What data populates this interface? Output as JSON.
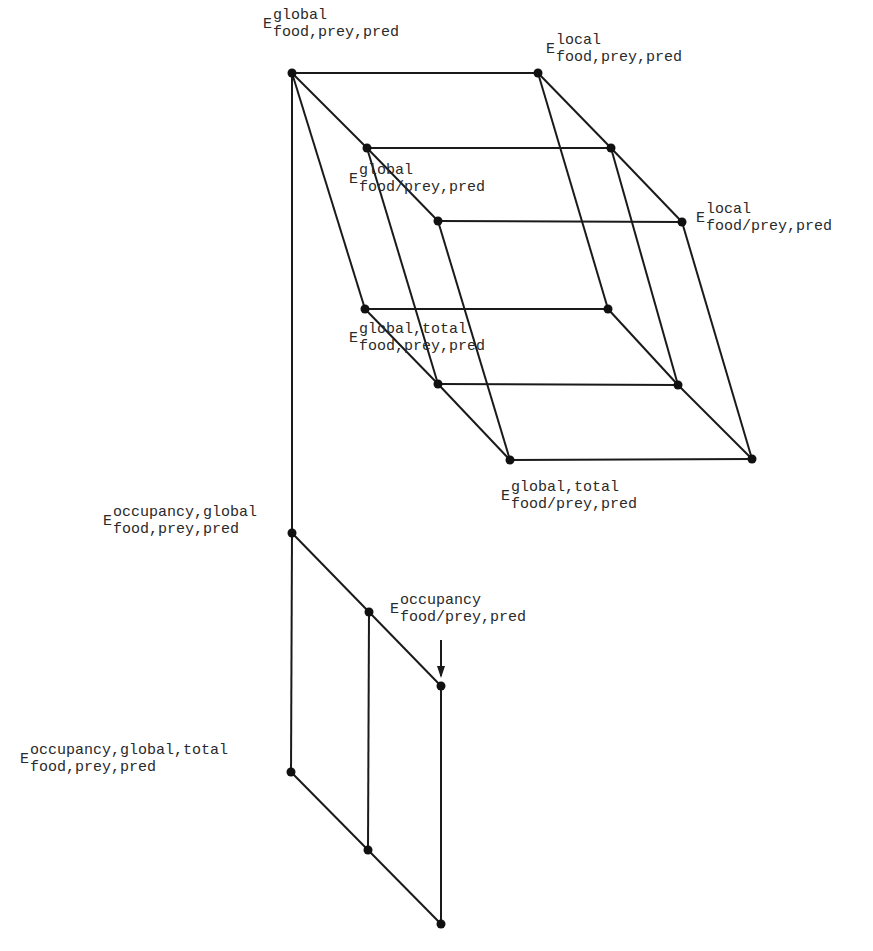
{
  "diagram": {
    "type": "hierarchy-lattice",
    "colors": {
      "line": "#1a1a1a",
      "node": "#111111",
      "text": "#2a2a2a",
      "background": "#ffffff"
    },
    "nodes": [
      {
        "id": "A",
        "x": 292,
        "y": 73
      },
      {
        "id": "B",
        "x": 367,
        "y": 148
      },
      {
        "id": "C",
        "x": 438,
        "y": 221
      },
      {
        "id": "G",
        "x": 538,
        "y": 73
      },
      {
        "id": "H",
        "x": 611,
        "y": 148
      },
      {
        "id": "I",
        "x": 682,
        "y": 222
      },
      {
        "id": "D",
        "x": 365,
        "y": 309
      },
      {
        "id": "E",
        "x": 438,
        "y": 384
      },
      {
        "id": "F",
        "x": 510,
        "y": 460
      },
      {
        "id": "J",
        "x": 608,
        "y": 309
      },
      {
        "id": "K",
        "x": 678,
        "y": 385
      },
      {
        "id": "L",
        "x": 752,
        "y": 459
      },
      {
        "id": "M",
        "x": 292,
        "y": 533
      },
      {
        "id": "N",
        "x": 369,
        "y": 612
      },
      {
        "id": "O",
        "x": 441,
        "y": 686
      },
      {
        "id": "P",
        "x": 291,
        "y": 772
      },
      {
        "id": "Q",
        "x": 368,
        "y": 850
      },
      {
        "id": "R",
        "x": 441,
        "y": 924
      }
    ],
    "edges": [
      [
        "A",
        "G"
      ],
      [
        "B",
        "H"
      ],
      [
        "C",
        "I"
      ],
      [
        "A",
        "B"
      ],
      [
        "B",
        "C"
      ],
      [
        "G",
        "H"
      ],
      [
        "H",
        "I"
      ],
      [
        "D",
        "J"
      ],
      [
        "E",
        "K"
      ],
      [
        "F",
        "L"
      ],
      [
        "D",
        "E"
      ],
      [
        "E",
        "F"
      ],
      [
        "J",
        "K"
      ],
      [
        "K",
        "L"
      ],
      [
        "A",
        "D"
      ],
      [
        "B",
        "E"
      ],
      [
        "C",
        "F"
      ],
      [
        "G",
        "J"
      ],
      [
        "H",
        "K"
      ],
      [
        "I",
        "L"
      ],
      [
        "A",
        "M"
      ],
      [
        "M",
        "P"
      ],
      [
        "M",
        "N"
      ],
      [
        "N",
        "O"
      ],
      [
        "P",
        "Q"
      ],
      [
        "Q",
        "R"
      ],
      [
        "N",
        "Q"
      ],
      [
        "O",
        "R"
      ]
    ],
    "arrow": {
      "x": 441,
      "y1": 640,
      "y2": 680
    },
    "labels": [
      {
        "id": "top-left",
        "base": "E",
        "sup": "global",
        "sub": "food,prey,pred",
        "x": 263,
        "y": 8
      },
      {
        "id": "top-right",
        "base": "E",
        "sup": "local",
        "sub": "food,prey,pred",
        "x": 546,
        "y": 33
      },
      {
        "id": "mid-left",
        "base": "E",
        "sup": "global",
        "sub": "food/prey,pred",
        "x": 349,
        "y": 163
      },
      {
        "id": "mid-right",
        "base": "E",
        "sup": "local",
        "sub": "food/prey,pred",
        "x": 696,
        "y": 202
      },
      {
        "id": "low-left",
        "base": "E",
        "sup": "global,total",
        "sub": "food,prey,pred",
        "x": 349,
        "y": 322
      },
      {
        "id": "low-right",
        "base": "E",
        "sup": "global,total",
        "sub": "food/prey,pred",
        "x": 501,
        "y": 480
      },
      {
        "id": "occ-global",
        "base": "E",
        "sup": "occupancy,global",
        "sub": "food,prey,pred",
        "x": 103,
        "y": 505
      },
      {
        "id": "occ",
        "base": "E",
        "sup": "occupancy",
        "sub": "food/prey,pred",
        "x": 390,
        "y": 593
      },
      {
        "id": "occ-global-total",
        "base": "E",
        "sup": "occupancy,global,total",
        "sub": "food,prey,pred",
        "x": 20,
        "y": 743
      }
    ]
  }
}
